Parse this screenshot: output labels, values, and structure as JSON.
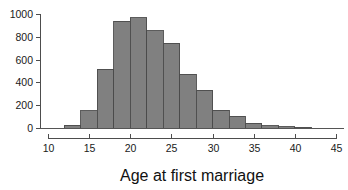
{
  "chart_data": {
    "type": "bar",
    "title": "",
    "subtitle": "",
    "xlabel": "Age at first marriage",
    "ylabel": "",
    "categories": [
      12,
      14,
      16,
      18,
      20,
      22,
      24,
      26,
      28,
      30,
      32,
      34,
      36,
      38,
      40
    ],
    "values": [
      25,
      150,
      515,
      935,
      965,
      855,
      745,
      470,
      330,
      155,
      105,
      40,
      20,
      10,
      5
    ],
    "bin_width": 2,
    "bin_edges": [
      12,
      14,
      16,
      18,
      20,
      22,
      24,
      26,
      28,
      30,
      32,
      34,
      36,
      38,
      40,
      42
    ],
    "xlim": [
      10,
      45
    ],
    "ylim": [
      0,
      1000
    ],
    "xticks": [
      10,
      15,
      20,
      25,
      30,
      35,
      40,
      45
    ],
    "yticks": [
      0,
      200,
      400,
      600,
      800,
      1000
    ],
    "xtick_labels": [
      "10",
      "15",
      "20",
      "25",
      "30",
      "35",
      "40",
      "45"
    ],
    "ytick_labels": [
      "0",
      "200",
      "400",
      "600",
      "800",
      "1000"
    ],
    "grid": false,
    "legend": null,
    "legend_position": "none",
    "bar_fill_color": "#808080",
    "bar_edge_color": "#4a4a4a",
    "axis_color": "#4d4d4d",
    "text_color": "#1a1a1a",
    "background_color": "#ffffff"
  },
  "figure": {
    "axis_title": "Age at first marriage"
  }
}
